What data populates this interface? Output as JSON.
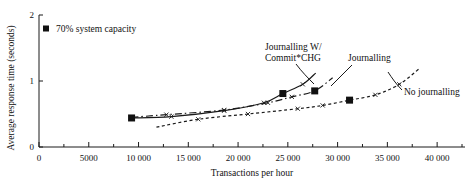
{
  "chart_data": {
    "type": "line",
    "title": "",
    "xlabel": "Transactions per hour",
    "ylabel": "Average response time (seconds)",
    "xlim": [
      0,
      42800
    ],
    "ylim": [
      0,
      2
    ],
    "grid": false,
    "legend_position": "top-left",
    "x_ticks": [
      0,
      5000,
      10000,
      15000,
      20000,
      25000,
      30000,
      35000,
      40000
    ],
    "x_tick_labels": [
      "0",
      "5000",
      "10 000",
      "15 000",
      "20 000",
      "25 000",
      "30 000",
      "35 000",
      "40 000"
    ],
    "y_ticks": [
      0,
      1,
      2
    ],
    "y_tick_labels": [
      "0",
      "1",
      "2"
    ],
    "legend": [
      {
        "label": "70% system capacity",
        "marker": "filled-square"
      }
    ],
    "series": [
      {
        "name": "Journalling W/ Commit*CHG",
        "style": "solid",
        "label_lines": [
          "Journalling W/",
          "Commit*CHG"
        ],
        "points": [
          {
            "x": 9300,
            "y": 0.44
          },
          {
            "x": 13300,
            "y": 0.46
          },
          {
            "x": 18600,
            "y": 0.55
          },
          {
            "x": 22600,
            "y": 0.67
          },
          {
            "x": 24500,
            "y": 0.81
          },
          {
            "x": 26500,
            "y": 0.95
          },
          {
            "x": 27800,
            "y": 1.12
          }
        ]
      },
      {
        "name": "Journalling",
        "style": "dash-dot",
        "label_lines": [
          "Journalling"
        ],
        "points": [
          {
            "x": 9300,
            "y": 0.45
          },
          {
            "x": 12800,
            "y": 0.49
          },
          {
            "x": 18600,
            "y": 0.56
          },
          {
            "x": 23000,
            "y": 0.67
          },
          {
            "x": 25400,
            "y": 0.76
          },
          {
            "x": 27700,
            "y": 0.85
          },
          {
            "x": 29500,
            "y": 1.05
          }
        ]
      },
      {
        "name": "No journalling",
        "style": "dotted",
        "label_lines": [
          "No journalling"
        ],
        "points": [
          {
            "x": 11800,
            "y": 0.3
          },
          {
            "x": 16000,
            "y": 0.42
          },
          {
            "x": 21000,
            "y": 0.5
          },
          {
            "x": 26000,
            "y": 0.58
          },
          {
            "x": 28500,
            "y": 0.63
          },
          {
            "x": 31200,
            "y": 0.71
          },
          {
            "x": 33800,
            "y": 0.79
          },
          {
            "x": 36200,
            "y": 0.95
          },
          {
            "x": 38300,
            "y": 1.2
          }
        ]
      }
    ],
    "capacity_markers": [
      {
        "x": 9300,
        "y": 0.44
      },
      {
        "x": 24500,
        "y": 0.81
      },
      {
        "x": 27700,
        "y": 0.85
      },
      {
        "x": 31200,
        "y": 0.71
      }
    ],
    "x_tick_minor_count": 1
  },
  "colors": {
    "ink": "#1a1a1a",
    "background": "#ffffff"
  }
}
